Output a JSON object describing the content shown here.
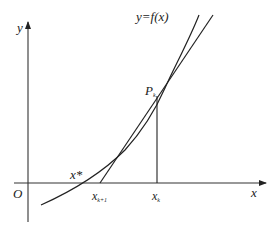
{
  "diagram": {
    "labels": {
      "y_axis": "y",
      "x_axis": "x",
      "origin": "O",
      "curve": "y=f(x)",
      "point": "P",
      "point_sub": "k",
      "root": "x*",
      "x_next": "x",
      "x_next_sub": "k+1",
      "x_k": "x",
      "x_k_sub": "k"
    },
    "colors": {
      "stroke": "#222222",
      "axis": "#333333",
      "background": "#ffffff"
    }
  }
}
